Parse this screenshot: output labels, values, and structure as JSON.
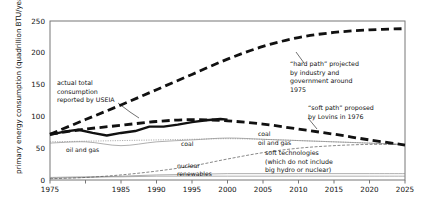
{
  "chart_data": {
    "type": "line",
    "title": "",
    "xlabel": "",
    "ylabel": "primary energy consumption (quadrillion BTU/year)",
    "xlim": [
      1975,
      2025
    ],
    "ylim": [
      0,
      250
    ],
    "grid": false,
    "legend_position": "inline-annotations",
    "xticks": [
      1975,
      1980,
      1985,
      1990,
      1995,
      2000,
      2005,
      2010,
      2015,
      2020,
      2025
    ],
    "xtick_labels": [
      "1975",
      "",
      "1985",
      "1990",
      "1995",
      "2000",
      "2005",
      "2010",
      "2015",
      "2020",
      "2025"
    ],
    "yticks": [
      0,
      50,
      100,
      150,
      200,
      250
    ],
    "ytick_labels": [
      "0",
      "50",
      "100",
      "150",
      "200",
      "250"
    ],
    "series": [
      {
        "name": "actual total consumption reported by USEIA",
        "style": "solid-thick",
        "x": [
          1975,
          1977,
          1979,
          1981,
          1983,
          1985,
          1987,
          1989,
          1991,
          1993,
          1995,
          1997,
          1999,
          2000
        ],
        "values": [
          71,
          76,
          79,
          74,
          70,
          74,
          77,
          84,
          84,
          87,
          91,
          94,
          96,
          95
        ]
      },
      {
        "name": "“hard path” projected by industry and government around 1975",
        "style": "dashed-thick",
        "x": [
          1975,
          1980,
          1985,
          1990,
          1995,
          2000,
          2005,
          2010,
          2015,
          2020,
          2025
        ],
        "values": [
          72,
          95,
          118,
          142,
          166,
          190,
          210,
          224,
          232,
          236,
          238
        ]
      },
      {
        "name": "“soft path” proposed by Lovins in 1976",
        "style": "dashed-thick",
        "x": [
          1975,
          1980,
          1985,
          1990,
          1995,
          2000,
          2005,
          2010,
          2015,
          2020,
          2025
        ],
        "values": [
          72,
          80,
          86,
          92,
          95,
          93,
          88,
          80,
          72,
          63,
          55
        ]
      },
      {
        "name": "oil and gas",
        "style": "solid-thin",
        "x": [
          1975,
          1980,
          1985,
          1990,
          1995,
          2000,
          2005,
          2010,
          2015,
          2020,
          2025
        ],
        "values": [
          58,
          60,
          54,
          60,
          63,
          66,
          64,
          62,
          60,
          58,
          56
        ]
      },
      {
        "name": "coal",
        "style": "dotted-thin",
        "x": [
          1975,
          1980,
          1985,
          1990,
          1995,
          2000,
          2005,
          2010,
          2015,
          2020,
          2025
        ],
        "values": [
          60,
          61,
          62,
          63,
          64,
          65,
          64,
          62,
          60,
          58,
          55
        ]
      },
      {
        "name": "soft technologies (which do not include big hydro or nuclear)",
        "style": "dashdot-thin",
        "x": [
          1975,
          1980,
          1985,
          1990,
          1995,
          2000,
          2005,
          2010,
          2015,
          2020,
          2025
        ],
        "values": [
          2,
          4,
          8,
          14,
          22,
          33,
          43,
          50,
          54,
          56,
          56
        ]
      },
      {
        "name": "nuclear",
        "style": "solid-thin",
        "x": [
          1975,
          1980,
          1985,
          1990,
          1995,
          2000,
          2005,
          2010,
          2015,
          2020,
          2025
        ],
        "values": [
          3,
          4,
          6,
          8,
          9,
          10,
          10,
          10,
          10,
          10,
          10
        ]
      },
      {
        "name": "renewables",
        "style": "solid-thin",
        "x": [
          1975,
          1980,
          1985,
          1990,
          1995,
          2000,
          2005,
          2010,
          2015,
          2020,
          2025
        ],
        "values": [
          4,
          5,
          5,
          6,
          6,
          6,
          6,
          6,
          6,
          6,
          6
        ]
      }
    ],
    "annotations": [
      {
        "id": "actual-total",
        "lines": [
          "actual total",
          "consumption",
          "reported by USEIA"
        ],
        "leader": true
      },
      {
        "id": "hard-path",
        "lines": [
          "“hard path” projected",
          "by industry and",
          "government around",
          "1975"
        ],
        "leader": true
      },
      {
        "id": "soft-path",
        "lines": [
          "“soft path” proposed",
          "by Lovins in 1976"
        ],
        "leader": true
      },
      {
        "id": "soft-technologies",
        "lines": [
          "soft technologies",
          "(which do not include",
          "big hydro or nuclear)"
        ],
        "leader": false
      }
    ],
    "inline_labels": [
      {
        "id": "oil-and-gas-left",
        "text": "oil and gas"
      },
      {
        "id": "coal-left",
        "text": "coal"
      },
      {
        "id": "coal-right",
        "text": "coal"
      },
      {
        "id": "oil-and-gas-right",
        "text": "oil and gas"
      },
      {
        "id": "nuclear",
        "text": "nuclear"
      },
      {
        "id": "renewables",
        "text": "renewables"
      }
    ],
    "colors": {
      "axis": "#6b6b6b",
      "thick_line": "#111111",
      "thin_line": "#8c8c8c",
      "text": "#111111",
      "background": "#ffffff"
    }
  }
}
